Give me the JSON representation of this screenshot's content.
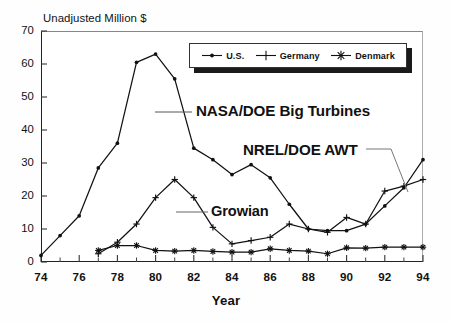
{
  "chart_data": {
    "type": "line",
    "title": "Unadjusted Million $",
    "xlabel": "Year",
    "ylabel": "Unadjusted Million $",
    "xlim": [
      74,
      94
    ],
    "ylim": [
      0,
      70
    ],
    "grid": false,
    "legend_position": "top-right-inside",
    "x": [
      74,
      75,
      76,
      77,
      78,
      79,
      80,
      81,
      82,
      83,
      84,
      85,
      86,
      87,
      88,
      89,
      90,
      91,
      92,
      93,
      94
    ],
    "y_ticks": [
      0,
      10,
      20,
      30,
      40,
      50,
      60,
      70
    ],
    "y_tick_labels": [
      "0",
      "10",
      "20",
      "30",
      "40",
      "50",
      "60",
      "70"
    ],
    "x_ticks": [
      74,
      76,
      78,
      80,
      82,
      84,
      86,
      88,
      90,
      92,
      94
    ],
    "x_tick_labels": [
      "74",
      "76",
      "78",
      "80",
      "82",
      "84",
      "86",
      "88",
      "90",
      "92",
      "94"
    ],
    "x_minor_ticks": [
      75,
      77,
      79,
      81,
      83,
      85,
      87,
      89,
      91,
      93
    ],
    "series": [
      {
        "name": "U.S.",
        "marker": "dot",
        "color": "#111111",
        "values": [
          2.0,
          8.0,
          14.0,
          28.5,
          36.0,
          60.5,
          63.0,
          55.5,
          34.5,
          31.0,
          26.5,
          29.5,
          25.5,
          17.5,
          10.0,
          9.5,
          9.5,
          11.5,
          17.0,
          22.5,
          31.0
        ]
      },
      {
        "name": "Germany",
        "marker": "plus",
        "color": "#111111",
        "values": [
          null,
          null,
          null,
          2.5,
          6.0,
          11.5,
          19.5,
          25.0,
          19.5,
          10.5,
          5.5,
          6.5,
          7.5,
          11.5,
          10.0,
          9.0,
          13.5,
          11.5,
          21.5,
          23.0,
          25.0
        ]
      },
      {
        "name": "Denmark",
        "marker": "asterisk",
        "color": "#111111",
        "values": [
          null,
          null,
          null,
          3.5,
          5.0,
          5.0,
          3.5,
          3.3,
          3.5,
          3.2,
          3.0,
          3.0,
          4.0,
          3.5,
          3.3,
          2.5,
          4.3,
          4.2,
          4.5,
          4.5,
          4.5
        ]
      }
    ],
    "annotations": [
      {
        "text": "NASA/DOE Big Turbines",
        "points_to_series": "U.S.",
        "leader": "left"
      },
      {
        "text": "NREL/DOE AWT",
        "points_to_series": "U.S.",
        "leader": "right-down"
      },
      {
        "text": "Growian",
        "points_to_series": "Germany",
        "leader": "left"
      }
    ]
  },
  "legend": {
    "items": [
      {
        "label": "U.S.",
        "marker": "dot-marker"
      },
      {
        "label": "Germany",
        "marker": "plus-marker"
      },
      {
        "label": "Denmark",
        "marker": "asterisk-marker"
      }
    ]
  },
  "axes": {
    "y_title": "Unadjusted Million $",
    "x_title": "Year"
  }
}
